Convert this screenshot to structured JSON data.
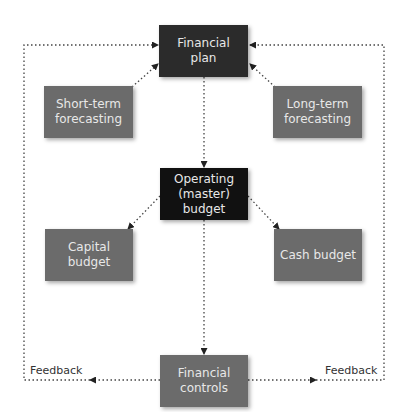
{
  "diagram": {
    "nodes": {
      "financial_plan": "Financial plan",
      "short_term": "Short-term forecasting",
      "long_term": "Long-term forecasting",
      "operating_budget": "Operating (master) budget",
      "capital_budget": "Capital budget",
      "cash_budget": "Cash budget",
      "financial_controls": "Financial controls"
    },
    "labels": {
      "feedback_left": "Feedback",
      "feedback_right": "Feedback"
    },
    "colors": {
      "top_box": "#2b2b2b",
      "operating_box": "#111111",
      "grey_box": "#6b6b6b",
      "line": "#333333"
    },
    "edges": [
      {
        "from": "short_term",
        "to": "financial_plan"
      },
      {
        "from": "long_term",
        "to": "financial_plan"
      },
      {
        "from": "financial_plan",
        "to": "operating_budget"
      },
      {
        "from": "operating_budget",
        "to": "capital_budget"
      },
      {
        "from": "operating_budget",
        "to": "cash_budget"
      },
      {
        "from": "operating_budget",
        "to": "financial_controls"
      },
      {
        "from": "financial_controls",
        "to": "financial_plan",
        "label": "Feedback",
        "side": "left"
      },
      {
        "from": "financial_controls",
        "to": "financial_plan",
        "label": "Feedback",
        "side": "right"
      }
    ]
  }
}
